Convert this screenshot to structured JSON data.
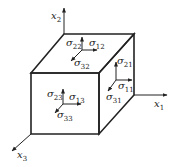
{
  "diagram": {
    "axes": {
      "x1": {
        "symbol": "x",
        "index": "1"
      },
      "x2": {
        "symbol": "x",
        "index": "2"
      },
      "x3": {
        "symbol": "x",
        "index": "3"
      }
    },
    "faces": {
      "top": {
        "normal": {
          "symbol": "σ",
          "index": "22"
        },
        "shear_x": {
          "symbol": "σ",
          "index": "12"
        },
        "shear_z": {
          "symbol": "σ",
          "index": "32"
        }
      },
      "right": {
        "normal": {
          "symbol": "σ",
          "index": "11"
        },
        "shear_y": {
          "symbol": "σ",
          "index": "21"
        },
        "shear_z": {
          "symbol": "σ",
          "index": "31"
        }
      },
      "front": {
        "normal": {
          "symbol": "σ",
          "index": "33"
        },
        "shear_x": {
          "symbol": "σ",
          "index": "13"
        },
        "shear_y": {
          "symbol": "σ",
          "index": "23"
        }
      }
    },
    "colors": {
      "line": "#222222",
      "background": "#ffffff"
    }
  }
}
